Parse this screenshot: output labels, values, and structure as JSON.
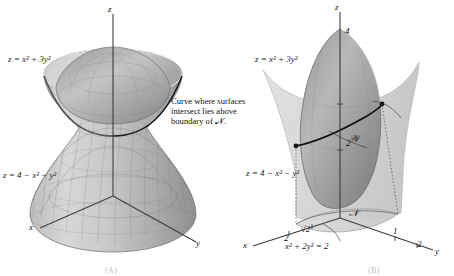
{
  "figure": {
    "panels": [
      {
        "id": "A",
        "caption": "(A)",
        "axes": {
          "x": "x",
          "y": "y",
          "z": "z"
        },
        "labels": {
          "upper_surface": "z = x² + 3y²",
          "lower_surface": "z = 4 − x² − y²"
        }
      },
      {
        "id": "B",
        "caption": "(B)",
        "axes": {
          "x": "x",
          "y": "y",
          "z": "z"
        },
        "labels": {
          "upper_surface": "z = x² + 3y²",
          "lower_surface": "z = 4 − x² − y²",
          "solid_region": "𝒲",
          "domain_region": "𝒩",
          "boundary_curve": "x² + 2y² = 2"
        },
        "annotation": {
          "line1": "Curve where surfaces",
          "line2": "intersect lies above",
          "line3": "boundary of 𝒩."
        },
        "ticks": {
          "z_upper": "4",
          "z_lower": "2",
          "x_axis": "2",
          "x_sqrt": "√2",
          "y_inner": "1",
          "y_outer": "2"
        }
      }
    ],
    "colors": {
      "surface_light": "#d7d7d7",
      "surface_mid": "#b4b4b4",
      "surface_dark": "#8e8e8e",
      "mesh_line": "#6f6f6f",
      "axis": "#3a3a3a",
      "curve": "#111111",
      "text": "#111111",
      "caption": "#b9b9b9"
    }
  }
}
